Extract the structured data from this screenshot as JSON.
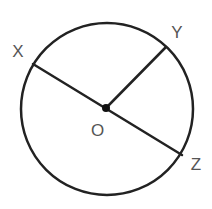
{
  "diagram": {
    "type": "circle-geometry",
    "circle": {
      "center": {
        "x": 107,
        "y": 109
      },
      "radius": 86,
      "stroke": "#222222",
      "stroke_width": 2.5
    },
    "center_point": {
      "label": "O",
      "x": 106,
      "y": 108,
      "dot_radius": 4,
      "label_x": 97.5,
      "label_y": 136
    },
    "points": [
      {
        "label": "X",
        "x": 33,
        "y": 64,
        "label_x": 18,
        "label_y": 57
      },
      {
        "label": "Y",
        "x": 166,
        "y": 47,
        "label_x": 177,
        "label_y": 38
      },
      {
        "label": "Z",
        "x": 182,
        "y": 155,
        "label_x": 196,
        "label_y": 170
      }
    ],
    "segments": [
      {
        "from": "X",
        "to": "Z",
        "kind": "diameter",
        "through": "O"
      },
      {
        "from": "O",
        "to": "Y",
        "kind": "radius"
      }
    ],
    "colors": {
      "line": "#222222",
      "label": "#555555",
      "background": "#ffffff"
    }
  }
}
